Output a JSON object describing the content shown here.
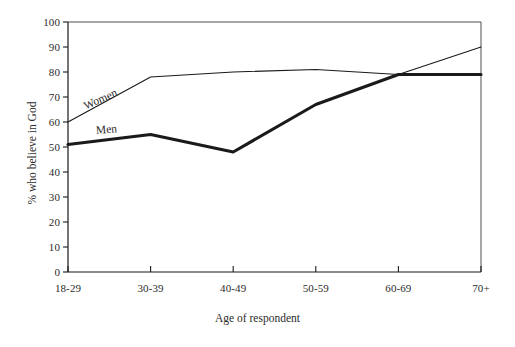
{
  "chart_data": {
    "type": "line",
    "title": "",
    "xlabel": "Age of respondent",
    "ylabel": "% who believe in God",
    "categories": [
      "18-29",
      "30-39",
      "40-49",
      "50-59",
      "60-69",
      "70+"
    ],
    "series": [
      {
        "name": "Women",
        "values": [
          60,
          78,
          80,
          81,
          79,
          90
        ],
        "style": "thin",
        "color": "#1a1a1a"
      },
      {
        "name": "Men",
        "values": [
          51,
          55,
          48,
          67,
          79,
          79
        ],
        "style": "thick",
        "color": "#1a1a1a"
      }
    ],
    "ylim": [
      0,
      100
    ],
    "yticks": [
      0,
      10,
      20,
      30,
      40,
      50,
      60,
      70,
      80,
      90,
      100
    ],
    "ytick_labels": [
      "0",
      "10",
      "20",
      "30",
      "40",
      "50",
      "60",
      "70",
      "80",
      "90",
      "100"
    ],
    "grid": false,
    "legend": "inline-labels"
  },
  "figure": {
    "background_color": "#ffffff",
    "axis_color": "#1a1a1a",
    "text_color": "#2b2b2b"
  }
}
